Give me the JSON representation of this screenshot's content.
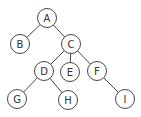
{
  "diagram": {
    "type": "tree",
    "style": {
      "stroke": "#444444",
      "fill": "#ffffff",
      "text": "#333333",
      "radius": 9.5
    },
    "nodes": [
      {
        "id": "A",
        "label": "A",
        "x": 47,
        "y": 18
      },
      {
        "id": "B",
        "label": "B",
        "x": 20,
        "y": 44
      },
      {
        "id": "C",
        "label": "C",
        "x": 71,
        "y": 44
      },
      {
        "id": "D",
        "label": "D",
        "x": 44,
        "y": 71
      },
      {
        "id": "E",
        "label": "E",
        "x": 70,
        "y": 72
      },
      {
        "id": "F",
        "label": "F",
        "x": 97,
        "y": 71
      },
      {
        "id": "G",
        "label": "G",
        "x": 17,
        "y": 99
      },
      {
        "id": "H",
        "label": "H",
        "x": 68,
        "y": 100
      },
      {
        "id": "I",
        "label": "I",
        "x": 125,
        "y": 99
      }
    ],
    "edges": [
      {
        "from": "A",
        "to": "B"
      },
      {
        "from": "A",
        "to": "C"
      },
      {
        "from": "C",
        "to": "D"
      },
      {
        "from": "C",
        "to": "E"
      },
      {
        "from": "C",
        "to": "F"
      },
      {
        "from": "D",
        "to": "G"
      },
      {
        "from": "D",
        "to": "H"
      },
      {
        "from": "F",
        "to": "I"
      }
    ]
  }
}
